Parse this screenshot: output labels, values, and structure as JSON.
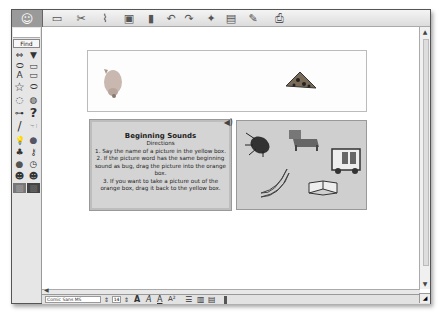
{
  "toolbar": {
    "logo": "☺",
    "icons": [
      {
        "name": "background-icon",
        "glyph": "▭"
      },
      {
        "name": "cut-icon",
        "glyph": "✂"
      },
      {
        "name": "magnet-icon",
        "glyph": "⌇"
      },
      {
        "name": "paint-bucket-icon",
        "glyph": "▣"
      },
      {
        "name": "eraser-icon",
        "glyph": "▮"
      },
      {
        "name": "undo-icon",
        "glyph": "↶"
      },
      {
        "name": "redo-icon",
        "glyph": "↷"
      },
      {
        "name": "bug-icon",
        "glyph": "✦"
      },
      {
        "name": "page-link-icon",
        "glyph": "▤"
      },
      {
        "name": "pencil-icon",
        "glyph": "✎"
      },
      {
        "name": "print-icon",
        "glyph": "⎙"
      }
    ]
  },
  "sidebar": {
    "find_label": "Find",
    "tools": [
      {
        "name": "arrows-icon",
        "glyph": "⇔"
      },
      {
        "name": "dropdown-icon",
        "glyph": "▼"
      },
      {
        "name": "oval-button-icon",
        "glyph": "⬭"
      },
      {
        "name": "rect-button-icon",
        "glyph": "▭"
      },
      {
        "name": "text-icon",
        "glyph": "A"
      },
      {
        "name": "field-icon",
        "glyph": "▭"
      },
      {
        "name": "star-icon",
        "glyph": "☆"
      },
      {
        "name": "cloud-icon",
        "glyph": "⬭"
      },
      {
        "name": "speech-bubble-icon",
        "glyph": "◌"
      },
      {
        "name": "thought-bubble-icon",
        "glyph": "◍"
      },
      {
        "name": "connector-icon",
        "glyph": "⊶"
      },
      {
        "name": "question-icon",
        "glyph": "?"
      },
      {
        "name": "pencil-tool-icon",
        "glyph": "/"
      },
      {
        "name": "hand-icon",
        "glyph": "☜"
      },
      {
        "name": "lightbulb-icon",
        "glyph": "💡"
      },
      {
        "name": "globe-icon",
        "glyph": "●"
      },
      {
        "name": "tree-icon",
        "glyph": "♣"
      },
      {
        "name": "key-icon",
        "glyph": "⚷"
      },
      {
        "name": "apple-icon",
        "glyph": "●"
      },
      {
        "name": "clock-icon",
        "glyph": "◷"
      },
      {
        "name": "boy-icon",
        "glyph": "☻"
      },
      {
        "name": "girl-icon",
        "glyph": "☻"
      },
      {
        "name": "photo-icon",
        "glyph": "▩"
      },
      {
        "name": "photo-dark-icon",
        "glyph": "▩"
      }
    ]
  },
  "canvas": {
    "yellow_box": {
      "items": [
        "pig",
        "pizza"
      ]
    },
    "directions": {
      "title": "Beginning Sounds",
      "subtitle": "Directions",
      "lines": [
        "1. Say the name of a picture in the yellow box.",
        "2. If the picture word has the same beginning sound as bug, drag the picture into the orange box.",
        "3. If you want to take a picture out  of the orange box, drag it back to the yellow box."
      ]
    },
    "orange_box": {
      "items": [
        "bug",
        "bed",
        "bus",
        "bananas",
        "book"
      ]
    }
  },
  "statusbar": {
    "font": "Comic Sans MS",
    "size": "14",
    "bold": "A",
    "italic": "A",
    "underline": "A",
    "superscript": "A²"
  }
}
